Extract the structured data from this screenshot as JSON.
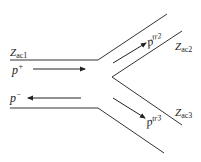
{
  "diagram": {
    "title": "",
    "impedances": {
      "main": {
        "base": "Z",
        "sub": "ac1"
      },
      "branch_upper": {
        "base": "Z",
        "sub": "ac2"
      },
      "branch_lower": {
        "base": "Z",
        "sub": "ac3"
      }
    },
    "waves": {
      "incident": {
        "base": "p",
        "sup": "+"
      },
      "reflected": {
        "base": "p",
        "sup": "−"
      },
      "transmitted_upper": {
        "base": "p",
        "sup": "tr2"
      },
      "transmitted_lower": {
        "base": "p",
        "sup": "tr3"
      }
    },
    "colors": {
      "line": "#333333",
      "arrow": "#222222"
    }
  }
}
